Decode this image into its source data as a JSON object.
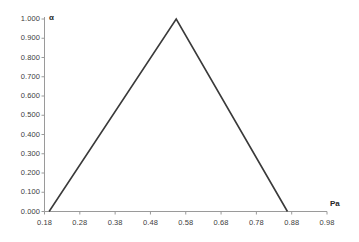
{
  "chart_data": {
    "type": "line",
    "title": "",
    "subtitle": "",
    "xlabel": "Pa",
    "ylabel": "α",
    "xlim": [
      0.18,
      0.98
    ],
    "ylim": [
      0.0,
      1.0
    ],
    "grid": false,
    "legend": null,
    "legend_position": "none",
    "x_ticks": [
      "0.18",
      "0.28",
      "0.38",
      "0.48",
      "0.58",
      "0.68",
      "0.78",
      "0.88",
      "0.98"
    ],
    "x_tick_values": [
      0.18,
      0.28,
      0.38,
      0.48,
      0.58,
      0.68,
      0.78,
      0.88,
      0.98
    ],
    "y_ticks": [
      "0.000",
      "0.100",
      "0.200",
      "0.300",
      "0.400",
      "0.500",
      "0.600",
      "0.700",
      "0.800",
      "0.900",
      "1.000"
    ],
    "y_tick_values": [
      0.0,
      0.1,
      0.2,
      0.3,
      0.4,
      0.5,
      0.6,
      0.7,
      0.8,
      0.9,
      1.0
    ],
    "series": [
      {
        "name": "alpha",
        "color": "#3a3a3a",
        "x": [
          0.193,
          0.553,
          0.868
        ],
        "y": [
          0.0,
          1.0,
          0.0
        ]
      }
    ],
    "annotations": [],
    "axis_color": "#9a9a9a",
    "line_color": "#3a3a3a",
    "tick_label_color": "#404040",
    "axis_title_color": "#262626",
    "background_color": "#ffffff"
  }
}
